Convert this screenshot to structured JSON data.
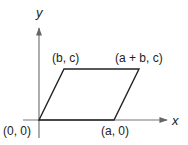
{
  "diagram": {
    "type": "parallelogram-on-axes",
    "axes": {
      "x_label": "x",
      "y_label": "y"
    },
    "vertices": [
      {
        "name": "origin",
        "label": "(0, 0)"
      },
      {
        "name": "a0",
        "label": "(a, 0)"
      },
      {
        "name": "bc",
        "label": "(b, c)"
      },
      {
        "name": "abc",
        "label": "(a + b, c)"
      }
    ],
    "colors": {
      "axis": "#555555",
      "shape": "#222222",
      "text": "#222222"
    }
  }
}
